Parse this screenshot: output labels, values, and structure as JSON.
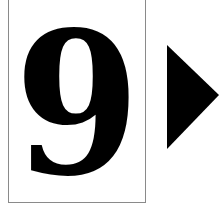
{
  "card": {
    "digit": "9"
  },
  "next_button": {
    "icon": "play-triangle-right-icon",
    "color": "#000000"
  },
  "colors": {
    "background": "#ffffff",
    "card_border": "#8a8a8a",
    "digit": "#000000"
  }
}
